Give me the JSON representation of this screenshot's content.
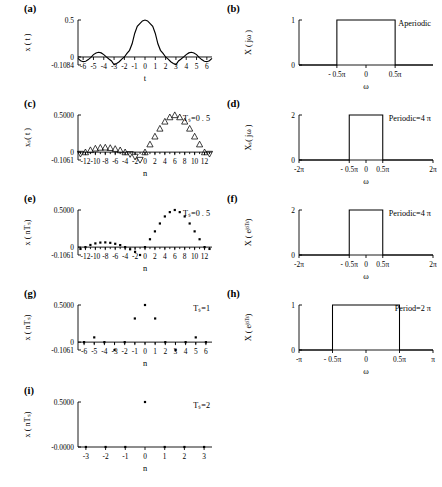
{
  "figure": {
    "title": "",
    "panel_labels": [
      "(a)",
      "(b)",
      "(c)",
      "(d)",
      "(e)",
      "(f)",
      "(g)",
      "(h)",
      "(i)",
      "(j)"
    ]
  },
  "chart_data": [
    {
      "id": "a",
      "panel_label": "(a)",
      "type": "line",
      "title": "",
      "xlabel": "t",
      "ylabel": "x ( t )",
      "note": "",
      "xlim": [
        -6.5,
        6.5
      ],
      "ylim": [
        -0.1084,
        0.5
      ],
      "xticks": [
        -6,
        -5,
        -4,
        -3,
        -2,
        -1,
        0,
        1,
        2,
        3,
        4,
        5,
        6
      ],
      "xticklabels": [
        "-6",
        "-5",
        "-4",
        "-3",
        "-2",
        "-1",
        "0",
        "1",
        "2",
        "3",
        "4",
        "5",
        "6"
      ],
      "yticks": [
        0.5,
        0,
        -0.1084
      ],
      "yticklabels": [
        "0.5",
        "0",
        "-0.1084"
      ],
      "grid": false,
      "function": "0.5*sinc(0.5*t)",
      "x": [
        -6.5,
        -6.25,
        -6,
        -5.75,
        -5.5,
        -5.25,
        -5,
        -4.75,
        -4.5,
        -4.25,
        -4,
        -3.75,
        -3.5,
        -3.25,
        -3,
        -2.75,
        -2.5,
        -2.25,
        -2,
        -1.75,
        -1.5,
        -1.25,
        -1,
        -0.75,
        -0.5,
        -0.25,
        0,
        0.25,
        0.5,
        0.75,
        1,
        1.25,
        1.5,
        1.75,
        2,
        2.25,
        2.5,
        2.75,
        3,
        3.25,
        3.5,
        3.75,
        4,
        4.25,
        4.5,
        4.75,
        5,
        5.25,
        5.5,
        5.75,
        6,
        6.25,
        6.5
      ],
      "y": [
        -0.0196,
        -0.05,
        -0.0637,
        -0.0578,
        -0.0354,
        -0.0045,
        0.0318,
        0.0544,
        0.0637,
        0.0552,
        0.0318,
        0.0015,
        -0.0273,
        -0.0538,
        -0.1061,
        -0.0866,
        -0.0637,
        -0.029,
        0.0,
        0.0497,
        0.09,
        0.1784,
        0.3183,
        0.4132,
        0.4502,
        0.4873,
        0.5,
        0.4873,
        0.4502,
        0.4132,
        0.3183,
        0.1784,
        0.09,
        0.0497,
        0.0,
        -0.029,
        -0.0637,
        -0.0866,
        -0.1061,
        -0.0538,
        -0.0273,
        0.0015,
        0.0318,
        0.0552,
        0.0637,
        0.0544,
        0.0318,
        -0.0045,
        -0.0354,
        -0.0578,
        -0.0637,
        -0.05,
        -0.0196
      ]
    },
    {
      "id": "b",
      "panel_label": "(b)",
      "type": "step",
      "title": "",
      "xlabel": "ω",
      "ylabel": "X ( jω )",
      "note": "Aperiodic",
      "xlim": [
        -1.15,
        1.15
      ],
      "ylim": [
        0,
        1
      ],
      "xticks": [
        -0.5,
        0,
        0.5
      ],
      "xticklabels": [
        "- 0.5π",
        "0",
        "0.5π"
      ],
      "yticks": [
        1,
        0
      ],
      "yticklabels": [
        "1",
        "0"
      ],
      "grid": false,
      "pulse": {
        "from": -0.5,
        "to": 0.5,
        "height": 1,
        "baseline": 0
      }
    },
    {
      "id": "c",
      "panel_label": "(c)",
      "type": "scatter",
      "title": "",
      "xlabel": "n",
      "ylabel": "xₛ( t )",
      "note": "Tₛ=0 . 5",
      "marker": "triangle",
      "xlim": [
        -13.5,
        13.5
      ],
      "ylim": [
        -0.1061,
        0.5
      ],
      "xticks": [
        -12,
        -10,
        -8,
        -6,
        -4,
        -2,
        0,
        2,
        4,
        6,
        8,
        10,
        12
      ],
      "xticklabels": [
        "-12",
        "-10",
        "-8",
        "-6",
        "-4",
        "-2",
        "0",
        "2",
        "4",
        "6",
        "8",
        "10",
        "12"
      ],
      "yticks": [
        0.5,
        0,
        -0.1061
      ],
      "yticklabels": [
        "0.5000",
        "0",
        "-0.1061"
      ],
      "grid": false,
      "x": [
        -13,
        -12,
        -11,
        -10,
        -9,
        -8,
        -7,
        -6,
        -5,
        -4,
        -3,
        -2,
        -1,
        0,
        1,
        2,
        3,
        4,
        5,
        6,
        7,
        8,
        9,
        10,
        11,
        12,
        13
      ],
      "y": [
        -0.0245,
        0.0,
        0.0289,
        0.05,
        0.0612,
        0.0637,
        0.0577,
        0.045,
        0.0273,
        0.0,
        -0.0289,
        -0.0637,
        -0.1061,
        0.0,
        0.1061,
        0.2122,
        0.3183,
        0.4132,
        0.4714,
        0.5,
        0.4714,
        0.4132,
        0.3183,
        0.2122,
        0.1061,
        0.0,
        -0.0245
      ]
    },
    {
      "id": "d",
      "panel_label": "(d)",
      "type": "step",
      "title": "",
      "xlabel": "ω",
      "ylabel": "Xₛ( jω )",
      "note": "Periodic=4 π",
      "xlim": [
        -2,
        2
      ],
      "ylim": [
        0,
        2
      ],
      "xticks": [
        -2,
        -0.5,
        0,
        0.5,
        2
      ],
      "xticklabels": [
        "-2π",
        "- 0.5π",
        "0",
        "0.5π",
        "2π"
      ],
      "yticks": [
        2,
        0
      ],
      "yticklabels": [
        "2",
        "0"
      ],
      "grid": false,
      "pulse": {
        "from": -0.5,
        "to": 0.5,
        "height": 2,
        "baseline": 0
      }
    },
    {
      "id": "e",
      "panel_label": "(e)",
      "type": "scatter",
      "title": "",
      "xlabel": "n",
      "ylabel": "x ( nTₛ)",
      "note": "Tₛ=0 . 5",
      "marker": "dot",
      "xlim": [
        -13.5,
        13.5
      ],
      "ylim": [
        -0.1061,
        0.5
      ],
      "xticks": [
        -12,
        -10,
        -8,
        -6,
        -4,
        -2,
        0,
        2,
        4,
        6,
        8,
        10,
        12
      ],
      "xticklabels": [
        "-12",
        "-10",
        "-8",
        "-6",
        "-4",
        "-2",
        "0",
        "2",
        "4",
        "6",
        "8",
        "10",
        "12"
      ],
      "yticks": [
        0.5,
        0,
        -0.1061
      ],
      "yticklabels": [
        "0.5000",
        "0",
        "-0.1061"
      ],
      "grid": false,
      "x": [
        -13,
        -12,
        -11,
        -10,
        -9,
        -8,
        -7,
        -6,
        -5,
        -4,
        -3,
        -2,
        -1,
        0,
        1,
        2,
        3,
        4,
        5,
        6,
        7,
        8,
        9,
        10,
        11,
        12,
        13
      ],
      "y": [
        -0.0245,
        0.0,
        0.0289,
        0.05,
        0.0612,
        0.0637,
        0.0577,
        0.045,
        0.0273,
        0.0,
        -0.0289,
        -0.0637,
        -0.1061,
        0.0,
        0.1061,
        0.2122,
        0.3183,
        0.4132,
        0.4714,
        0.5,
        0.4714,
        0.4132,
        0.3183,
        0.2122,
        0.1061,
        0.0,
        -0.0245
      ]
    },
    {
      "id": "f",
      "panel_label": "(f)",
      "type": "step",
      "title": "",
      "xlabel": "ω",
      "ylabel": "X ( eʲᵒᵀˢ)",
      "note": "Periodic=4 π",
      "xlim": [
        -2,
        2
      ],
      "ylim": [
        0,
        2
      ],
      "xticks": [
        -2,
        -0.5,
        0,
        0.5,
        2
      ],
      "xticklabels": [
        "-2π",
        "- 0.5π",
        "0",
        "0.5π",
        "2π"
      ],
      "yticks": [
        2,
        0
      ],
      "yticklabels": [
        "2",
        "0"
      ],
      "grid": false,
      "pulse": {
        "from": -0.5,
        "to": 0.5,
        "height": 2,
        "baseline": 0
      }
    },
    {
      "id": "g",
      "panel_label": "(g)",
      "type": "scatter",
      "title": "",
      "xlabel": "n",
      "ylabel": "x ( nTₛ)",
      "note": "Tₛ=1",
      "marker": "dot",
      "xlim": [
        -6.6,
        6.6
      ],
      "ylim": [
        -0.1061,
        0.5
      ],
      "xticks": [
        -6,
        -5,
        -4,
        -3,
        -2,
        -1,
        0,
        1,
        2,
        3,
        4,
        5,
        6
      ],
      "xticklabels": [
        "-6",
        "-5",
        "-4",
        "-3",
        "-2",
        "-1",
        "0",
        "1",
        "2",
        "3",
        "4",
        "5",
        "6"
      ],
      "yticks": [
        0.5,
        0,
        -0.1061
      ],
      "yticklabels": [
        "0.5000",
        "0",
        "-0.1061"
      ],
      "grid": false,
      "x": [
        -6,
        -5,
        -4,
        -3,
        -2,
        -1,
        0,
        1,
        2,
        3,
        4,
        5,
        6
      ],
      "y": [
        0.0,
        0.0637,
        0.0,
        -0.1061,
        0.0,
        0.3183,
        0.5,
        0.3183,
        0.0,
        -0.1061,
        0.0,
        0.0637,
        0.0
      ]
    },
    {
      "id": "h",
      "panel_label": "(h)",
      "type": "step",
      "title": "",
      "xlabel": "ω",
      "ylabel": "X ( eʲᵒᵀˢ)",
      "note": "Period=2 π",
      "xlim": [
        -1,
        1
      ],
      "ylim": [
        0,
        1
      ],
      "xticks": [
        -1,
        -0.5,
        0,
        0.5,
        1
      ],
      "xticklabels": [
        "-π",
        "- 0.5π",
        "0",
        "0.5π",
        "π"
      ],
      "yticks": [
        1,
        0
      ],
      "yticklabels": [
        "1",
        "0"
      ],
      "grid": false,
      "pulse": {
        "from": -0.5,
        "to": 0.5,
        "height": 1,
        "baseline": 0
      }
    },
    {
      "id": "i",
      "panel_label": "(i)",
      "type": "scatter",
      "title": "",
      "xlabel": "n",
      "ylabel": "x ( nTₛ)",
      "note": "Tₛ=2",
      "marker": "dot",
      "xlim": [
        -3.4,
        3.4
      ],
      "ylim": [
        0,
        0.5
      ],
      "xticks": [
        -3,
        -2,
        -1,
        0,
        1,
        2,
        3
      ],
      "xticklabels": [
        "-3",
        "-2",
        "-1",
        "0",
        "1",
        "2",
        "3"
      ],
      "yticks": [
        0.5,
        0
      ],
      "yticklabels": [
        "0.5000",
        "-0.0000"
      ],
      "grid": false,
      "x": [
        -3,
        -2,
        -1,
        0,
        1,
        2,
        3
      ],
      "y": [
        0,
        0,
        0,
        0.5,
        0,
        0,
        0
      ]
    },
    {
      "id": "j",
      "panel_label": "(j)",
      "type": "step",
      "title": "",
      "xlabel": "ω",
      "ylabel": "X ( eʲᵒ ᵀˢ)",
      "note": "Period=π",
      "xlim": [
        -0.5,
        0.5
      ],
      "ylim": [
        0,
        0.5
      ],
      "xticks": [
        -0.5,
        0,
        0.5
      ],
      "xticklabels": [
        "-0.5π",
        "0",
        "0.5π"
      ],
      "yticks": [
        0.5,
        0
      ],
      "yticklabels": [
        "0.5",
        "0"
      ],
      "grid": false,
      "constant": 0.5
    }
  ]
}
